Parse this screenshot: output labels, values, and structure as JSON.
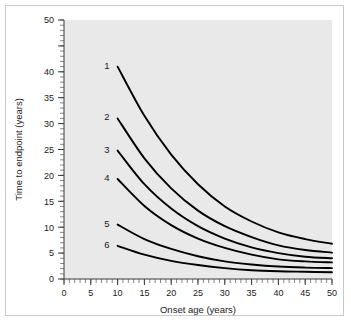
{
  "chart_data": {
    "type": "line",
    "title": "",
    "xlabel": "Onset age (years)",
    "ylabel": "Time to endpoint (years)",
    "xlim": [
      0,
      50
    ],
    "ylim": [
      0,
      50
    ],
    "grid": false,
    "legend_position": "inline-curve-labels",
    "x_major_ticks": [
      0,
      5,
      10,
      15,
      20,
      25,
      30,
      35,
      40,
      45,
      50
    ],
    "x_tick_labels": [
      "0",
      "5",
      "10",
      "15",
      "20",
      "25",
      "30",
      "35",
      "40",
      "45",
      "50"
    ],
    "x_minor_tick_step": 1,
    "y_major_ticks": [
      0,
      5,
      10,
      15,
      20,
      25,
      30,
      35,
      40,
      45,
      50
    ],
    "y_tick_labels": [
      "0",
      "5",
      "10",
      "15",
      "20",
      "25",
      "30",
      "35",
      "40",
      "",
      "50"
    ],
    "y_minor_tick_step": 1,
    "x": [
      10,
      15,
      20,
      25,
      30,
      35,
      40,
      45,
      50
    ],
    "series": [
      {
        "name": "1",
        "label": "1",
        "values": [
          41.0,
          31.5,
          24.0,
          18.3,
          14.0,
          11.1,
          9.0,
          7.7,
          6.8
        ]
      },
      {
        "name": "2",
        "label": "2",
        "values": [
          31.0,
          23.3,
          17.5,
          13.2,
          10.2,
          8.1,
          6.5,
          5.6,
          5.1
        ]
      },
      {
        "name": "3",
        "label": "3",
        "values": [
          24.8,
          18.3,
          13.6,
          10.2,
          7.8,
          6.1,
          5.0,
          4.3,
          4.0
        ]
      },
      {
        "name": "4",
        "label": "4",
        "values": [
          19.3,
          14.1,
          10.4,
          7.8,
          6.0,
          4.7,
          3.8,
          3.4,
          3.2
        ]
      },
      {
        "name": "5",
        "label": "5",
        "values": [
          10.5,
          7.7,
          5.8,
          4.4,
          3.4,
          2.8,
          2.4,
          2.2,
          2.1
        ]
      },
      {
        "name": "6",
        "label": "6",
        "values": [
          6.4,
          4.7,
          3.5,
          2.7,
          2.1,
          1.7,
          1.5,
          1.4,
          1.3
        ]
      }
    ],
    "curve_label_positions": [
      {
        "label": "1",
        "x": 10,
        "y": 41.0
      },
      {
        "label": "2",
        "x": 10,
        "y": 31.0
      },
      {
        "label": "3",
        "x": 10,
        "y": 24.8
      },
      {
        "label": "4",
        "x": 10,
        "y": 19.3
      },
      {
        "label": "5",
        "x": 10,
        "y": 10.5
      },
      {
        "label": "6",
        "x": 10,
        "y": 6.4
      }
    ],
    "colors": {
      "curve": "#000000",
      "plot_background": "#e9e9e9",
      "figure_background": "#ffffff",
      "axis": "#3a3a3a",
      "frame_border": "#c9c9c9",
      "text": "#1a1a1a"
    }
  }
}
